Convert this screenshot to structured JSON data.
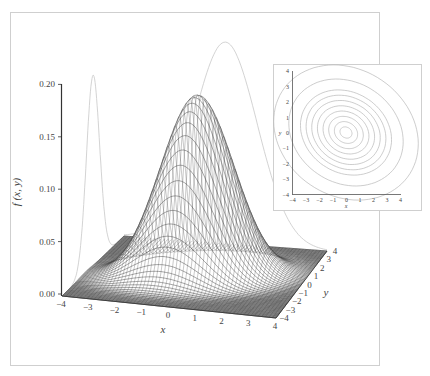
{
  "chart_data": [
    {
      "type": "surface3d",
      "title": "",
      "function": "bivariate normal density",
      "zlabel": "f (x, y)",
      "xlabel": "x",
      "ylabel": "y",
      "xlim": [
        -4,
        4
      ],
      "ylim": [
        -4,
        4
      ],
      "zlim": [
        0.0,
        0.2
      ],
      "z_ticks": [
        "0.00",
        "0.05",
        "0.10",
        "0.15",
        "0.20"
      ],
      "x_ticks": [
        "−4",
        "−3",
        "−2",
        "−1",
        "0",
        "1",
        "2",
        "3",
        "4"
      ],
      "y_ticks": [
        "−4",
        "−3",
        "−2",
        "−1",
        "0",
        "1",
        "2",
        "3",
        "4"
      ],
      "peak_value": 0.17,
      "mean": [
        0,
        0
      ],
      "sigma_x": 1.3,
      "sigma_y": 1.0,
      "rho": 0.3,
      "mesh_lines": 60,
      "marginal_curves": [
        {
          "name": "marginal in x (projected on back wall)",
          "peak_approx": 0.19
        },
        {
          "name": "marginal in y (projected on left wall)",
          "peak_approx": 0.18
        }
      ],
      "grid": false
    },
    {
      "type": "contour",
      "title": "",
      "xlabel": "x",
      "ylabel": "y",
      "xlim": [
        -4,
        4
      ],
      "ylim": [
        -4,
        4
      ],
      "x_ticks": [
        "−4",
        "−3",
        "−2",
        "−1",
        "0",
        "1",
        "2",
        "3",
        "4"
      ],
      "y_ticks": [
        "−4",
        "−3",
        "−2",
        "−1",
        "0",
        "1",
        "2",
        "3",
        "4"
      ],
      "contour_levels": 10,
      "grid": false
    }
  ],
  "colors": {
    "frame": "#cfcfcf",
    "axis": "#333333",
    "mesh": "#3a3a3a",
    "marginal": "#c8c8c8",
    "contour": "#b8b8b8",
    "text": "#444444"
  }
}
